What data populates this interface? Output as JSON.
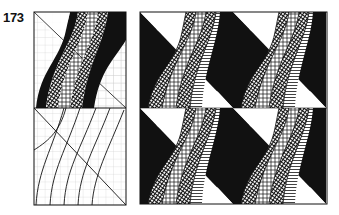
{
  "figure": {
    "number": "173",
    "left_panel": {
      "description": "Construction panel: grid with diagonal; top half shows S-shaped black and hatched bands, bottom half shows curved guide lines",
      "top_half": {
        "bands": [
          "black",
          "crosshatch-dense",
          "grid-hatch",
          "horizontal-hatch"
        ]
      },
      "bottom_half": {
        "curve_count": 5
      }
    },
    "right_panel": {
      "description": "2x2 tiled pattern of S-shaped hatched bands with black triangular fills",
      "tiles": [
        {
          "row": 0,
          "col": 0
        },
        {
          "row": 0,
          "col": 1
        },
        {
          "row": 1,
          "col": 0
        },
        {
          "row": 1,
          "col": 1
        }
      ]
    },
    "colors": {
      "ink": "#111111",
      "grid": "#bbbbbb",
      "paper": "#ffffff"
    }
  }
}
